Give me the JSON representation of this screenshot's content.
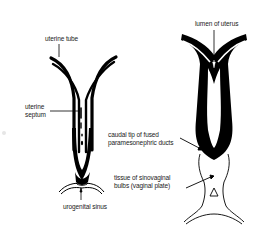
{
  "diagram": {
    "type": "anatomical-illustration",
    "colors": {
      "background": "#ffffff",
      "ink": "#000000",
      "label_text": "#1a1a1a"
    },
    "left_figure": {
      "labels": {
        "uterine_tube": "uterine tube",
        "uterine_septum_line1": "uterine",
        "uterine_septum_line2": "septum",
        "urogenital_sinus": "urogenital sinus"
      }
    },
    "right_figure": {
      "labels": {
        "lumen_of_uterus": "lumen of uterus",
        "caudal_tip_line1": "caudal tip of fused",
        "caudal_tip_line2": "paramesonephric ducts",
        "sinovaginal_line1": "tissue of sinovaginal",
        "sinovaginal_line2": "bulbs (vaginal plate)"
      }
    }
  }
}
